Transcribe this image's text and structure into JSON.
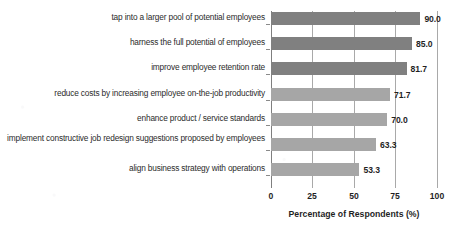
{
  "chart_data": {
    "type": "bar",
    "orientation": "horizontal",
    "title": "",
    "xlabel": "Percentage of Respondents (%)",
    "ylabel": "",
    "xlim": [
      0,
      100
    ],
    "xticks": [
      "0",
      "25",
      "50",
      "75",
      "100"
    ],
    "xtick_values": [
      0,
      25,
      50,
      75,
      100
    ],
    "grid": true,
    "legend": "none",
    "categories": [
      "tap into a larger pool of potential employees",
      "harness the full potential of employees",
      "improve employee retention rate",
      "reduce costs by increasing employee on-the-job productivity",
      "enhance product / service standards",
      "implement constructive job redesign suggestions proposed by employees",
      "align business strategy with operations"
    ],
    "values": [
      90.0,
      85.0,
      81.7,
      71.7,
      70.0,
      63.3,
      53.3
    ],
    "value_labels": [
      "90.0",
      "85.0",
      "81.7",
      "71.7",
      "70.0",
      "63.3",
      "53.3"
    ],
    "bar_colors": [
      "#808080",
      "#808080",
      "#808080",
      "#a6a6a6",
      "#a6a6a6",
      "#a6a6a6",
      "#a6a6a6"
    ]
  },
  "colors": {
    "bar_dark": "#808080",
    "bar_light": "#a6a6a6",
    "axis": "#7f7f7f",
    "gridline": "#a9a9a9",
    "text": "#1f1f1f",
    "background": "#ffffff"
  },
  "cropped_title_text": ""
}
